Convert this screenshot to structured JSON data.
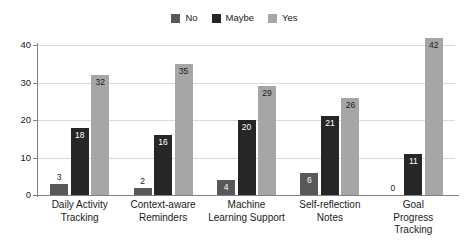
{
  "chart_data": {
    "type": "bar",
    "title": "",
    "subtitle": "",
    "xlabel": "",
    "ylabel": "",
    "ylim": [
      0,
      44
    ],
    "yticks": [
      0,
      10,
      20,
      30,
      40
    ],
    "grid": true,
    "legend_position": "top-center",
    "orientation": "vertical",
    "grouping": "grouped",
    "categories": [
      "Daily Activity\nTracking",
      "Context-aware\nReminders",
      "Machine\nLearning Support",
      "Self-reflection\nNotes",
      "Goal Progress\nTracking"
    ],
    "series": [
      {
        "name": "No",
        "color": "#595959",
        "values": [
          3,
          2,
          4,
          6,
          0
        ]
      },
      {
        "name": "Maybe",
        "color": "#262626",
        "values": [
          18,
          16,
          20,
          21,
          11
        ]
      },
      {
        "name": "Yes",
        "color": "#a6a6a6",
        "values": [
          32,
          35,
          29,
          26,
          42
        ]
      }
    ]
  },
  "legend": {
    "items": [
      {
        "label": "No",
        "color": "#595959"
      },
      {
        "label": "Maybe",
        "color": "#262626"
      },
      {
        "label": "Yes",
        "color": "#a6a6a6"
      }
    ]
  },
  "axis": {
    "y_tick_labels": [
      "0",
      "10",
      "20",
      "30",
      "40"
    ]
  },
  "colors": {
    "background": "#ffffff",
    "gridline": "#d9d9d9",
    "spine": "#808080",
    "text": "#1a1a1a",
    "label_on_dark": "#ffffff",
    "label_on_light": "#1a1a1a"
  }
}
